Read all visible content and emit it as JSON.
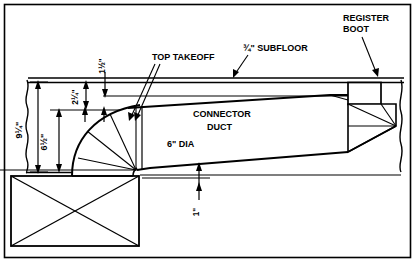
{
  "diagram": {
    "frame": {
      "border_color": "#000000",
      "background": "#ffffff"
    },
    "labels": {
      "register_boot_line1": "REGISTER",
      "register_boot_line2": "BOOT",
      "subfloor": "¾\" SUBFLOOR",
      "top_takeoff": "TOP TAKEOFF",
      "connector_duct_line1": "CONNECTOR",
      "connector_duct_line2": "DUCT",
      "duct_diameter": "6\" DIA"
    },
    "dimensions": [
      {
        "name": "overall-height",
        "value": "9¼\"",
        "orientation": "vertical"
      },
      {
        "name": "takeoff-height",
        "value": "6½\"",
        "orientation": "vertical"
      },
      {
        "name": "joist-offset",
        "value": "2¼\"",
        "orientation": "vertical"
      },
      {
        "name": "subfloor-gap",
        "value": "1½\"",
        "orientation": "vertical"
      },
      {
        "name": "bottom-clearance",
        "value": "1\"",
        "orientation": "vertical"
      }
    ],
    "components": [
      {
        "name": "plenum-box",
        "type": "rectangle-with-x-cross"
      },
      {
        "name": "elbow-transition",
        "type": "curved-segmented-elbow"
      },
      {
        "name": "connector-duct",
        "type": "tapered-duct"
      },
      {
        "name": "register-boot",
        "type": "tapered-boot"
      },
      {
        "name": "subfloor",
        "type": "horizontal-band"
      },
      {
        "name": "break-line-left",
        "type": "squiggle"
      },
      {
        "name": "break-line-right",
        "type": "squiggle"
      }
    ]
  }
}
